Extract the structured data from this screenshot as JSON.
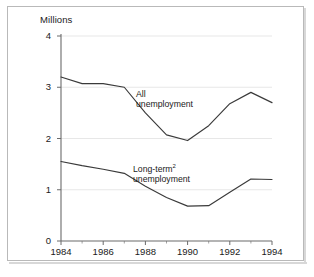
{
  "chart_data": {
    "type": "line",
    "title": "",
    "ylabel": "Millions",
    "xlabel": "",
    "ylim": [
      0,
      4
    ],
    "xlim": [
      1984,
      1994
    ],
    "yticks": [
      "0",
      "1",
      "2",
      "3",
      "4"
    ],
    "ytick_values": [
      0,
      1,
      2,
      3,
      4
    ],
    "xticks": [
      "1984",
      "1986",
      "1988",
      "1990",
      "1992",
      "1994"
    ],
    "xtick_values": [
      1984,
      1986,
      1988,
      1990,
      1992,
      1994
    ],
    "xminor_values": [
      1985,
      1987,
      1989,
      1991,
      1993
    ],
    "grid": "horizontal-faint",
    "legend": "inline-annotations",
    "x": [
      1984,
      1985,
      1986,
      1987,
      1988,
      1989,
      1990,
      1991,
      1992,
      1993,
      1994
    ],
    "series": [
      {
        "name": "All unemployment",
        "label_lines": [
          "All",
          "unemployment"
        ],
        "color": "#3a3a3a",
        "values": [
          3.2,
          3.07,
          3.07,
          3.0,
          2.5,
          2.07,
          1.96,
          2.25,
          2.68,
          2.9,
          2.7
        ]
      },
      {
        "name": "Long-term unemployment",
        "label_lines": [
          "Long-term",
          "unemployment"
        ],
        "label_superscript": "2",
        "color": "#3a3a3a",
        "values": [
          1.55,
          1.47,
          1.4,
          1.32,
          1.07,
          0.85,
          0.68,
          0.69,
          0.95,
          1.21,
          1.2
        ]
      }
    ],
    "annotations": [
      {
        "text": "All unemployment",
        "x": 1988.1,
        "y": 2.72
      },
      {
        "text": "Long-term² unemployment",
        "x": 1988.2,
        "y": 1.46
      }
    ]
  },
  "labels": {
    "y_axis_title": "Millions",
    "series_all_line1": "All",
    "series_all_line2": "unemployment",
    "series_lt_line1": "Long-term",
    "series_lt_sup": "2",
    "series_lt_line2": "unemployment"
  }
}
